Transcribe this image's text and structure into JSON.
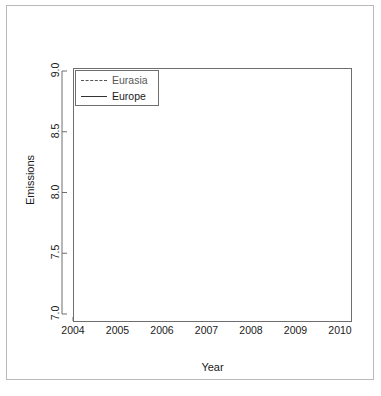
{
  "chart_data": {
    "type": "line",
    "title": "",
    "xlabel": "Year",
    "ylabel": "Emissions",
    "categories": [
      "2004",
      "2005",
      "2006",
      "2007",
      "2008",
      "2009",
      "2010"
    ],
    "x": [
      2004,
      2005,
      2006,
      2007,
      2008,
      2009,
      2010
    ],
    "series": [
      {
        "name": "Eurasia",
        "values": [
          8.5,
          8.5,
          8.7,
          8.6,
          8.9,
          8.0,
          8.4
        ],
        "linestyle": "dashed",
        "color": "#555555"
      },
      {
        "name": "Europe",
        "values": [
          7.9,
          7.9,
          7.9,
          7.8,
          7.7,
          7.1,
          7.2
        ],
        "linestyle": "solid",
        "color": "#333333"
      }
    ],
    "xlim": [
      2004,
      2010
    ],
    "ylim": [
      7.0,
      9.0
    ],
    "yticks": [
      "7.0",
      "7.5",
      "8.0",
      "8.5",
      "9.0"
    ],
    "ytick_values": [
      7.0,
      7.5,
      8.0,
      8.5,
      9.0
    ],
    "xticks": [
      "2004",
      "2005",
      "2006",
      "2007",
      "2008",
      "2009",
      "2010"
    ],
    "grid": false,
    "legend": {
      "position": "top-left",
      "entries": [
        {
          "label": "Eurasia",
          "linestyle": "dashed"
        },
        {
          "label": "Europe",
          "linestyle": "solid"
        }
      ]
    }
  },
  "figure": {
    "background": "#ffffff",
    "frame_color": "#b9b9b9",
    "axis_color": "#6e6e6e",
    "text_color": "#1a1a1a"
  }
}
